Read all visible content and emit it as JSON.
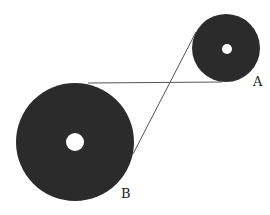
{
  "diagram": {
    "colors": {
      "pulley": "#2b2b2b",
      "belt": "#555555",
      "hole": "#ffffff",
      "background": "#ffffff"
    },
    "pulleys": [
      {
        "id": "A",
        "label": "A",
        "cx": 226,
        "cy": 48,
        "r": 34,
        "hole_r": 5,
        "label_x": 253,
        "label_y": 86
      },
      {
        "id": "B",
        "label": "B",
        "cx": 75,
        "cy": 142,
        "r": 59,
        "hole_r": 9,
        "label_x": 121,
        "label_y": 198
      }
    ],
    "belt_segments": [
      {
        "x1": 88,
        "y1": 83,
        "x2": 222,
        "y2": 82
      },
      {
        "x1": 196,
        "y1": 32,
        "x2": 133,
        "y2": 154
      }
    ]
  }
}
